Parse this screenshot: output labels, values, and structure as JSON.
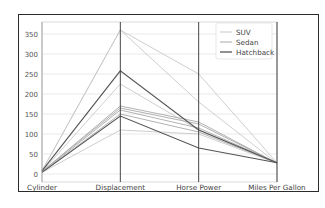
{
  "chart_data": {
    "type": "parallel_coordinates",
    "title": "",
    "axes": [
      "Cylinder",
      "Displacement",
      "Horse Power",
      "Miles Per Gallon"
    ],
    "ylim": [
      -20,
      380
    ],
    "yticks": [
      0,
      50,
      100,
      150,
      200,
      250,
      300,
      350
    ],
    "grid": true,
    "legend_position": "upper right",
    "legend": [
      "SUV",
      "Sedan",
      "Hatchback"
    ],
    "colors": {
      "SUV": "#c8c8c8",
      "Sedan": "#a9a9a9",
      "Hatchback": "#555555"
    },
    "series": [
      {
        "name": "SUV",
        "values": [
          8,
          360,
          250,
          28
        ]
      },
      {
        "name": "SUV",
        "values": [
          8,
          360,
          180,
          27
        ]
      },
      {
        "name": "SUV",
        "values": [
          6,
          225,
          110,
          28
        ]
      },
      {
        "name": "SUV",
        "values": [
          4,
          110,
          100,
          27
        ]
      },
      {
        "name": "Sedan",
        "values": [
          6,
          170,
          130,
          27
        ]
      },
      {
        "name": "Sedan",
        "values": [
          6,
          165,
          125,
          27
        ]
      },
      {
        "name": "Sedan",
        "values": [
          4,
          160,
          115,
          28
        ]
      },
      {
        "name": "Sedan",
        "values": [
          4,
          150,
          105,
          28
        ]
      },
      {
        "name": "Hatchback",
        "values": [
          8,
          258,
          110,
          28
        ]
      },
      {
        "name": "Hatchback",
        "values": [
          4,
          145,
          65,
          28
        ]
      }
    ]
  }
}
